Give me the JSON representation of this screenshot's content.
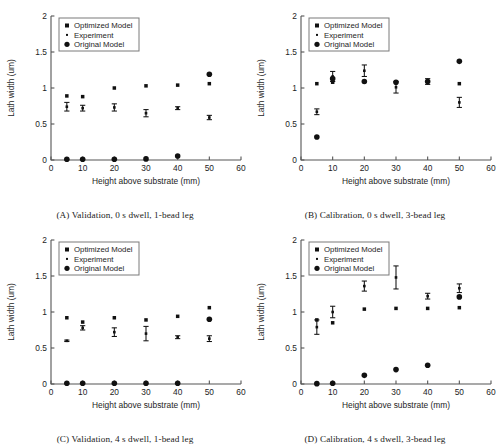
{
  "figure": {
    "layout": "2x2 grid of scatter plots",
    "panels": [
      "A",
      "B",
      "C",
      "D"
    ]
  },
  "common": {
    "xlabel": "Height above substrate (mm)",
    "ylabel": "Lath width (um)",
    "xticks": [
      "0",
      "10",
      "20",
      "30",
      "40",
      "50",
      "60"
    ],
    "yticks": [
      "0",
      "0.5",
      "1",
      "1.5",
      "2"
    ],
    "legend": [
      {
        "label": "Optimized Model",
        "marker": "square-marker"
      },
      {
        "label": "Experiment",
        "marker": "dot-marker"
      },
      {
        "label": "Original Model",
        "marker": "circle-marker"
      }
    ]
  },
  "chart_data": [
    {
      "panel": "A",
      "type": "scatter",
      "title": "(A) Validation, 0 s dwell, 1-bead leg",
      "xlabel": "Height above substrate (mm)",
      "ylabel": "Lath width (um)",
      "xlim": [
        0,
        60
      ],
      "ylim": [
        0,
        2
      ],
      "grid": false,
      "legend_position": "upper-left",
      "x": [
        5,
        10,
        20,
        30,
        40,
        50
      ],
      "series": [
        {
          "name": "Optimized Model",
          "marker": "square",
          "values": [
            0.89,
            0.88,
            1.0,
            1.03,
            1.04,
            1.06
          ]
        },
        {
          "name": "Experiment",
          "marker": "dot-with-errorbar",
          "values": [
            0.74,
            0.72,
            0.73,
            0.65,
            0.72,
            0.59
          ],
          "errors": [
            0.06,
            0.04,
            0.05,
            0.05,
            0.02,
            0.03
          ]
        },
        {
          "name": "Original Model",
          "marker": "circle",
          "values": [
            0.01,
            0.01,
            0.01,
            0.015,
            0.055,
            1.19
          ]
        }
      ]
    },
    {
      "panel": "B",
      "type": "scatter",
      "title": "(B) Calibration, 0 s dwell, 3-bead leg",
      "xlabel": "Height above substrate (mm)",
      "ylabel": "Lath width (um)",
      "xlim": [
        0,
        60
      ],
      "ylim": [
        0,
        2
      ],
      "grid": false,
      "legend_position": "upper-left",
      "x": [
        5,
        10,
        20,
        30,
        40,
        50
      ],
      "series": [
        {
          "name": "Optimized Model",
          "marker": "square",
          "values": [
            1.06,
            1.08,
            1.09,
            1.08,
            1.09,
            1.06
          ]
        },
        {
          "name": "Experiment",
          "marker": "dot-with-errorbar",
          "values": [
            0.67,
            1.16,
            1.24,
            1.01,
            1.09,
            0.8
          ],
          "errors": [
            0.04,
            0.07,
            0.08,
            0.08,
            0.04,
            0.07
          ]
        },
        {
          "name": "Original Model",
          "marker": "circle",
          "values": [
            0.32,
            1.13,
            1.09,
            1.08,
            1.09,
            1.37
          ]
        }
      ]
    },
    {
      "panel": "C",
      "type": "scatter",
      "title": "(C) Validation, 4 s dwell, 1-bead leg",
      "xlabel": "Height above substrate (mm)",
      "ylabel": "Lath width (um)",
      "xlim": [
        0,
        60
      ],
      "ylim": [
        0,
        2
      ],
      "grid": false,
      "legend_position": "upper-left",
      "x": [
        5,
        10,
        20,
        30,
        40,
        50
      ],
      "series": [
        {
          "name": "Optimized Model",
          "marker": "square",
          "values": [
            0.92,
            0.86,
            0.92,
            0.89,
            0.94,
            1.06
          ]
        },
        {
          "name": "Experiment",
          "marker": "dot-with-errorbar",
          "values": [
            0.6,
            0.78,
            0.72,
            0.7,
            0.65,
            0.63
          ],
          "errors": [
            0.01,
            0.03,
            0.06,
            0.1,
            0.02,
            0.04
          ]
        },
        {
          "name": "Original Model",
          "marker": "circle",
          "values": [
            0.01,
            0.01,
            0.01,
            0.01,
            0.01,
            0.9
          ]
        }
      ]
    },
    {
      "panel": "D",
      "type": "scatter",
      "title": "(D) Calibration, 4 s dwell, 3-bead leg",
      "xlabel": "Height above substrate (mm)",
      "ylabel": "Lath width (um)",
      "xlim": [
        0,
        60
      ],
      "ylim": [
        0,
        2
      ],
      "grid": false,
      "legend_position": "upper-left",
      "x": [
        5,
        10,
        20,
        30,
        40,
        50
      ],
      "series": [
        {
          "name": "Optimized Model",
          "marker": "square",
          "values": [
            0.89,
            0.85,
            1.04,
            1.05,
            1.05,
            1.06
          ]
        },
        {
          "name": "Experiment",
          "marker": "dot-with-errorbar",
          "values": [
            0.79,
            1.0,
            1.36,
            1.48,
            1.22,
            1.33
          ],
          "errors": [
            0.1,
            0.08,
            0.07,
            0.16,
            0.04,
            0.06
          ]
        },
        {
          "name": "Original Model",
          "marker": "circle",
          "values": [
            0.005,
            0.01,
            0.12,
            0.2,
            0.26,
            1.21
          ]
        }
      ]
    }
  ],
  "captions": {
    "a": "(A) Validation, 0 s dwell, 1-bead leg",
    "b": "(B) Calibration, 0 s dwell, 3-bead leg",
    "c": "(C) Validation, 4 s dwell, 1-bead leg",
    "d": "(D) Calibration, 4 s dwell, 3-bead leg"
  }
}
